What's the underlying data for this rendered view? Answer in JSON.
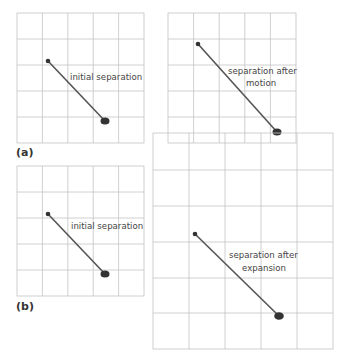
{
  "panels": {
    "a": {
      "label": "(a)",
      "left_caption": "initial separation",
      "right_caption_line1": "separation after",
      "right_caption_line2": "motion"
    },
    "b": {
      "label": "(b)",
      "left_caption": "initial separation",
      "right_caption_line1": "separation after",
      "right_caption_line2": "expansion"
    }
  },
  "colors": {
    "grid": "#c4c4c4",
    "line": "#555555",
    "dot": "#333333"
  }
}
